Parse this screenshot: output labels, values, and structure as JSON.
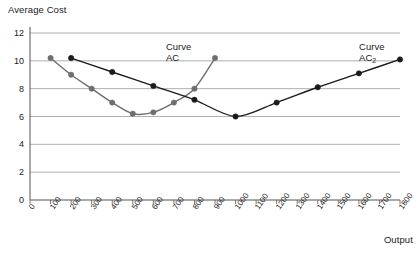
{
  "chart_data": {
    "type": "line",
    "title": "",
    "ylabel": "Average Cost",
    "xlabel": "Output",
    "xlim": [
      0,
      1800
    ],
    "ylim": [
      0,
      12
    ],
    "ytick_values": [
      0,
      2,
      4,
      6,
      8,
      10,
      12
    ],
    "xtick_values": [
      0,
      100,
      200,
      300,
      400,
      500,
      600,
      700,
      800,
      900,
      1000,
      1100,
      1200,
      1300,
      1400,
      1500,
      1600,
      1700,
      1800
    ],
    "grid": "horizontal",
    "legend_position": "inline-annotation",
    "annotations": [
      {
        "name": "curve-ac-label",
        "line1": "Curve",
        "line2": "AC",
        "sub": "",
        "x": 700,
        "y": 11.0
      },
      {
        "name": "curve-ac2-label",
        "line1": "Curve",
        "line2": "AC",
        "sub": "2",
        "x": 1640,
        "y": 11.0
      }
    ],
    "series": [
      {
        "name": "AC",
        "color": "#6e6e6e",
        "marker": "circle",
        "x": [
          100,
          200,
          300,
          400,
          500,
          600,
          700,
          800,
          900
        ],
        "y": [
          10.2,
          9.0,
          8.0,
          7.0,
          6.2,
          6.3,
          7.0,
          8.0,
          10.2
        ]
      },
      {
        "name": "AC2",
        "color": "#1a1a1a",
        "marker": "circle",
        "x": [
          200,
          400,
          600,
          800,
          1000,
          1200,
          1400,
          1600,
          1800
        ],
        "y": [
          10.2,
          9.2,
          8.2,
          7.2,
          6.0,
          7.0,
          8.1,
          9.1,
          10.1
        ]
      }
    ]
  },
  "colors": {
    "axis": "#555555",
    "grid": "#9a9a9a",
    "series_ac": "#6e6e6e",
    "series_ac2": "#1a1a1a",
    "background": "#ffffff"
  }
}
